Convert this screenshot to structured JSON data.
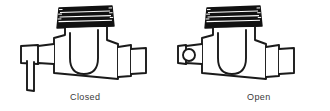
{
  "figure": {
    "width": 330,
    "height": 111,
    "background_color": "#ffffff",
    "line_color": "#1a1a1a",
    "fill_color": "#ffffff",
    "cap_color": "#111111",
    "caption_color": "#3a3a3a"
  },
  "views": [
    {
      "id": "closed",
      "caption": "Closed",
      "handle_state": "down",
      "handle_description": "lever arm pointing downward",
      "parts": [
        "ribbed-cap",
        "bonnet-neck",
        "valve-body",
        "handle-hub",
        "handle-lever",
        "outlet-collar",
        "outlet-pipe"
      ]
    },
    {
      "id": "open",
      "caption": "Open",
      "handle_state": "toward-viewer",
      "handle_description": "lever arm pointing toward viewer, shown end-on as a circle",
      "parts": [
        "ribbed-cap",
        "bonnet-neck",
        "valve-body",
        "handle-hub",
        "handle-end-circle",
        "outlet-collar",
        "outlet-pipe"
      ]
    }
  ],
  "captions": {
    "closed": "Closed",
    "open": "Open"
  }
}
